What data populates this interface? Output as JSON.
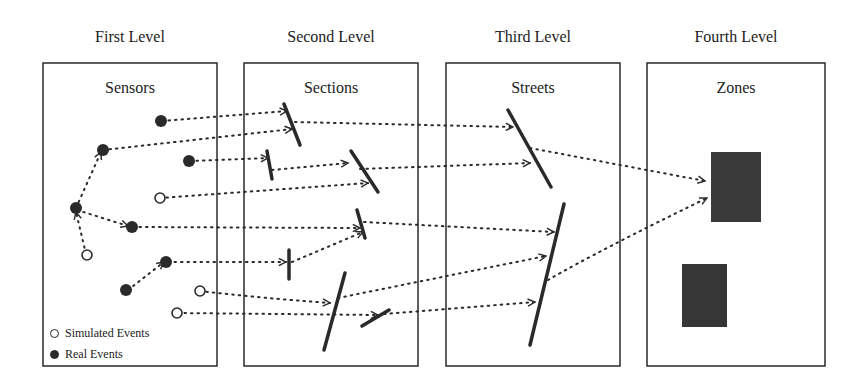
{
  "levels": [
    {
      "title": "First Level",
      "box_title": "Sensors"
    },
    {
      "title": "Second Level",
      "box_title": "Sections"
    },
    {
      "title": "Third Level",
      "box_title": "Streets"
    },
    {
      "title": "Fourth Level",
      "box_title": "Zones"
    }
  ],
  "legend": {
    "simulated": "Simulated Events",
    "real": "Real Events"
  },
  "colors": {
    "stroke": "#2a2a2a",
    "zone_fill": "#3a3a3a",
    "background": "#ffffff"
  }
}
